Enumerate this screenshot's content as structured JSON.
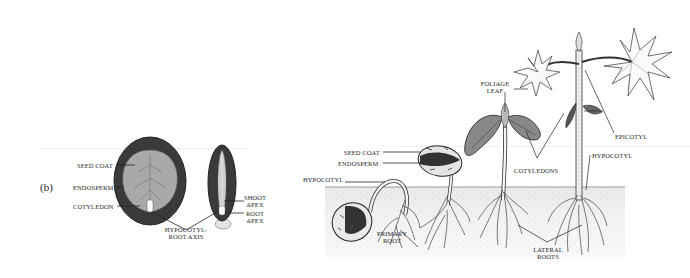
{
  "figure": {
    "panel_letter": "(b)"
  },
  "seed_section": {
    "labels": {
      "seed_coat": "SEED COAT",
      "endosperm": "ENDOSPERM",
      "cotyledon": "COTYLEDON",
      "hypocotyl_root_axis_1": "HYPOCOTYL-",
      "hypocotyl_root_axis_2": "ROOT AXIS",
      "shoot_apex_1": "SHOOT",
      "shoot_apex_2": "APEX",
      "root_apex_1": "ROOT",
      "root_apex_2": "APEX"
    }
  },
  "germination": {
    "labels": {
      "seed_coat": "SEED COAT",
      "endosperm": "ENDOSPERM",
      "hypocotyl_left": "HYPOCOTYL",
      "primary_root_1": "PRIMARY",
      "primary_root_2": "ROOT",
      "foliage_leaf_1": "FOLIAGE",
      "foliage_leaf_2": "LEAF",
      "cotyledons": "COTYLEDONS",
      "epicotyl": "EPICOTYL",
      "hypocotyl_right": "HYPOCOTYL",
      "lateral_roots_1": "LATERAL",
      "lateral_roots_2": "ROOTS"
    }
  },
  "colors": {
    "ink": "#222222",
    "endosperm_dark": "#3a3a3a",
    "cotyledon_gray": "#a9a9a9",
    "soil": "#e6e6e6",
    "background": "#ffffff"
  }
}
